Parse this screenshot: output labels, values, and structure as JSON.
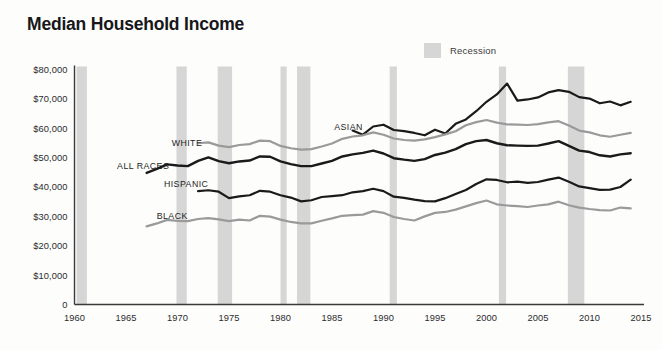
{
  "header": {
    "title": "Median Household Income"
  },
  "legend": {
    "items": [
      {
        "label": "Recession",
        "color": "#d6d6d6",
        "swatch_name": "recession-swatch"
      }
    ]
  },
  "chart_data": {
    "type": "line",
    "title": "Median Household Income",
    "xlabel": "",
    "ylabel": "",
    "xlim": [
      1960,
      2015
    ],
    "ylim": [
      0,
      80000
    ],
    "grid": false,
    "legend_position": "top-right",
    "xticks": [
      "1960",
      "1965",
      "1970",
      "1975",
      "1980",
      "1985",
      "1990",
      "1995",
      "2000",
      "2005",
      "2010",
      "2015"
    ],
    "xtick_values": [
      1960,
      1965,
      1970,
      1975,
      1980,
      1985,
      1990,
      1995,
      2000,
      2005,
      2010,
      2015
    ],
    "yticks": [
      "0",
      "$10,000",
      "$20,000",
      "$30,000",
      "$40,000",
      "$50,000",
      "$60,000",
      "$70,000",
      "$80,000"
    ],
    "ytick_values": [
      0,
      10000,
      20000,
      30000,
      40000,
      50000,
      60000,
      70000,
      80000
    ],
    "annotations": [
      {
        "text": "ASIAN",
        "x": 1988.0,
        "y": 60500,
        "anchor": "end"
      },
      {
        "text": "WHITE",
        "x": 1972.4,
        "y": 55000,
        "anchor": "end"
      },
      {
        "text": "ALL RACES",
        "x": 1969.2,
        "y": 47300,
        "anchor": "end"
      },
      {
        "text": "HISPANIC",
        "x": 1973.0,
        "y": 41200,
        "anchor": "end"
      },
      {
        "text": "BLACK",
        "x": 1971.0,
        "y": 30200,
        "anchor": "end"
      }
    ],
    "recessions": [
      {
        "start": 1960.2,
        "end": 1961.2
      },
      {
        "start": 1969.9,
        "end": 1970.9
      },
      {
        "start": 1973.9,
        "end": 1975.3
      },
      {
        "start": 1980.0,
        "end": 1980.6
      },
      {
        "start": 1981.6,
        "end": 1982.9
      },
      {
        "start": 1990.6,
        "end": 1991.3
      },
      {
        "start": 2001.2,
        "end": 2001.9
      },
      {
        "start": 2007.9,
        "end": 2009.5
      }
    ],
    "series": [
      {
        "name": "ASIAN",
        "color": "#1a1a1a",
        "width": 2.2,
        "x": [
          1987,
          1988,
          1989,
          1990,
          1991,
          1992,
          1993,
          1994,
          1995,
          1996,
          1997,
          1998,
          1999,
          2000,
          2001,
          2002,
          2003,
          2004,
          2005,
          2006,
          2007,
          2008,
          2009,
          2010,
          2011,
          2012,
          2013,
          2014
        ],
        "values": [
          59200,
          57800,
          60600,
          61200,
          59400,
          59000,
          58400,
          57600,
          59500,
          58200,
          61500,
          63000,
          65800,
          69000,
          71500,
          75200,
          69400,
          69800,
          70500,
          72200,
          73000,
          72400,
          70600,
          70100,
          68500,
          69100,
          67800,
          69000
        ]
      },
      {
        "name": "WHITE",
        "color": "#9a9a9a",
        "width": 2.2,
        "x": [
          1972,
          1973,
          1974,
          1975,
          1976,
          1977,
          1978,
          1979,
          1980,
          1981,
          1982,
          1983,
          1984,
          1985,
          1986,
          1987,
          1988,
          1989,
          1990,
          1991,
          1992,
          1993,
          1994,
          1995,
          1996,
          1997,
          1998,
          1999,
          2000,
          2001,
          2002,
          2003,
          2004,
          2005,
          2006,
          2007,
          2008,
          2009,
          2010,
          2011,
          2012,
          2013,
          2014
        ],
        "values": [
          54900,
          55200,
          54100,
          53600,
          54300,
          54600,
          55800,
          55600,
          54000,
          53200,
          52700,
          52900,
          53800,
          54800,
          56400,
          57200,
          57600,
          58600,
          57800,
          56500,
          56000,
          55800,
          56200,
          57000,
          57900,
          59000,
          61000,
          62100,
          62800,
          61900,
          61300,
          61200,
          61100,
          61400,
          62000,
          62400,
          60900,
          59200,
          58600,
          57600,
          57100,
          57800,
          58400
        ]
      },
      {
        "name": "ALL RACES",
        "color": "#1a1a1a",
        "width": 2.4,
        "x": [
          1967,
          1968,
          1969,
          1970,
          1971,
          1972,
          1973,
          1974,
          1975,
          1976,
          1977,
          1978,
          1979,
          1980,
          1981,
          1982,
          1983,
          1984,
          1985,
          1986,
          1987,
          1988,
          1989,
          1990,
          1991,
          1992,
          1993,
          1994,
          1995,
          1996,
          1997,
          1998,
          1999,
          2000,
          2001,
          2002,
          2003,
          2004,
          2005,
          2006,
          2007,
          2008,
          2009,
          2010,
          2011,
          2012,
          2013,
          2014
        ],
        "values": [
          44800,
          46200,
          47700,
          47300,
          47100,
          48900,
          50100,
          48800,
          48100,
          48700,
          49000,
          50400,
          50300,
          48700,
          47800,
          47100,
          47100,
          48000,
          48900,
          50400,
          51100,
          51600,
          52400,
          51400,
          49800,
          49300,
          48900,
          49500,
          50900,
          51700,
          52900,
          54600,
          55600,
          56000,
          54900,
          54200,
          54100,
          54000,
          54100,
          54800,
          55600,
          54000,
          52400,
          51900,
          50800,
          50400,
          51100,
          51500
        ]
      },
      {
        "name": "HISPANIC",
        "color": "#1a1a1a",
        "width": 2.2,
        "x": [
          1972,
          1973,
          1974,
          1975,
          1976,
          1977,
          1978,
          1979,
          1980,
          1981,
          1982,
          1983,
          1984,
          1985,
          1986,
          1987,
          1988,
          1989,
          1990,
          1991,
          1992,
          1993,
          1994,
          1995,
          1996,
          1997,
          1998,
          1999,
          2000,
          2001,
          2002,
          2003,
          2004,
          2005,
          2006,
          2007,
          2008,
          2009,
          2010,
          2011,
          2012,
          2013,
          2014
        ],
        "values": [
          38600,
          38900,
          38400,
          36200,
          36800,
          37200,
          38700,
          38400,
          37200,
          36400,
          35100,
          35500,
          36600,
          36900,
          37200,
          38200,
          38600,
          39400,
          38600,
          36700,
          36300,
          35700,
          35200,
          35100,
          36200,
          37600,
          39000,
          41000,
          42600,
          42400,
          41600,
          41800,
          41400,
          41700,
          42500,
          43200,
          41800,
          40200,
          39600,
          39000,
          39100,
          40000,
          42500
        ]
      },
      {
        "name": "BLACK",
        "color": "#9a9a9a",
        "width": 2.2,
        "x": [
          1967,
          1968,
          1969,
          1970,
          1971,
          1972,
          1973,
          1974,
          1975,
          1976,
          1977,
          1978,
          1979,
          1980,
          1981,
          1982,
          1983,
          1984,
          1985,
          1986,
          1987,
          1988,
          1989,
          1990,
          1991,
          1992,
          1993,
          1994,
          1995,
          1996,
          1997,
          1998,
          1999,
          2000,
          2001,
          2002,
          2003,
          2004,
          2005,
          2006,
          2007,
          2008,
          2009,
          2010,
          2011,
          2012,
          2013,
          2014
        ],
        "values": [
          26600,
          27600,
          28800,
          28500,
          28400,
          29100,
          29400,
          29000,
          28400,
          28900,
          28600,
          30200,
          29900,
          28900,
          28100,
          27600,
          27600,
          28500,
          29300,
          30200,
          30400,
          30600,
          31800,
          31200,
          29800,
          29100,
          28600,
          30000,
          31200,
          31500,
          32300,
          33400,
          34500,
          35400,
          34100,
          33700,
          33500,
          33200,
          33700,
          34100,
          35000,
          33800,
          33000,
          32500,
          32100,
          32000,
          33000,
          32700
        ]
      }
    ]
  },
  "axis": {
    "domain_color": "#3a3a3a",
    "recession_color": "#d6d6d6"
  }
}
